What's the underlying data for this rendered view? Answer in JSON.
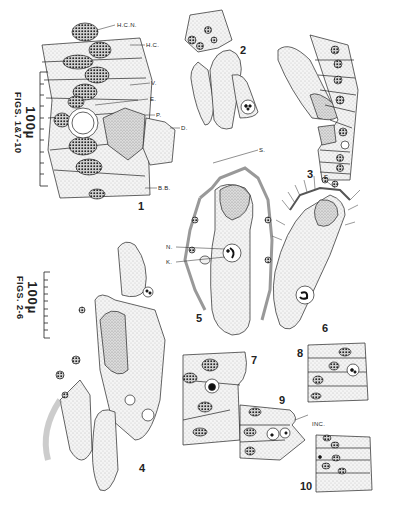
{
  "plate": {
    "scale_bars": [
      {
        "value": "100µ",
        "applies_to": "FIGS. 1 & 7-10"
      },
      {
        "value": "100µ",
        "applies_to": "FIGS. 2-6"
      }
    ],
    "figures": [
      {
        "number": "1"
      },
      {
        "number": "2"
      },
      {
        "number": "3"
      },
      {
        "number": "4"
      },
      {
        "number": "5"
      },
      {
        "number": "6"
      },
      {
        "number": "7"
      },
      {
        "number": "8"
      },
      {
        "number": "9"
      },
      {
        "number": "10"
      }
    ],
    "labels": {
      "hcn": "H.C.N.",
      "hc": "H.C.",
      "v": "V.",
      "e1": "E.",
      "p": "P.",
      "d": "D.",
      "bb": "B.B.",
      "s": "S.",
      "n": "N.",
      "k": "K.",
      "e6": "E.",
      "inc": "INC."
    },
    "colors": {
      "ink": "#1a1a1a",
      "stipple": "#d6d6d6",
      "dense": "#bdbdbd",
      "background": "#ffffff"
    }
  },
  "scale1": {
    "big": "100µ",
    "small": "FIGS. 1&7-10"
  },
  "scale2": {
    "big": "100µ",
    "small": "FIGS. 2-6"
  }
}
